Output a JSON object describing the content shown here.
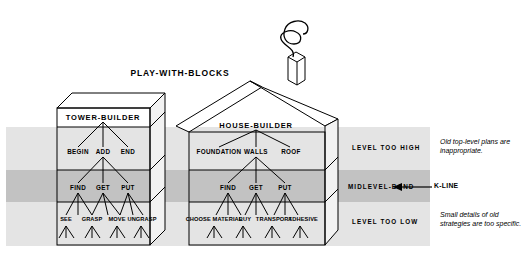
{
  "diagram": {
    "title": "PLAY-WITH-BLOCKS",
    "colors": {
      "ink": "#000000",
      "band_light": "#e2e2e2",
      "band_mid": "#bfbfbf",
      "face": "#ffffff",
      "side_face": "#f0f0f0"
    },
    "trees": [
      {
        "name": "tower-builder",
        "root": "TOWER-BUILDER",
        "level2": [
          "BEGIN",
          "ADD",
          "END"
        ],
        "level3": [
          "FIND",
          "GET",
          "PUT"
        ],
        "leaves": [
          "SEE",
          "GRASP",
          "MOVE",
          "UNGRASP"
        ]
      },
      {
        "name": "house-builder",
        "root": "HOUSE-BUILDER",
        "level2": [
          "FOUNDATION",
          "WALLS",
          "ROOF"
        ],
        "level3": [
          "FIND",
          "GET",
          "PUT"
        ],
        "leaves": [
          "CHOOSE MATERIAL",
          "BUY",
          "TRANSPORT",
          "ADHESIVE"
        ]
      }
    ],
    "bands": [
      {
        "id": "high",
        "label": "LEVEL TOO HIGH"
      },
      {
        "id": "mid",
        "label": "MIDLEVEL-BAND"
      },
      {
        "id": "low",
        "label": "LEVEL TOO LOW"
      }
    ],
    "kline": {
      "label": "K-LINE"
    },
    "notes": [
      {
        "id": "top-note",
        "text": "Old top-level plans are inappropriate."
      },
      {
        "id": "bottom-note",
        "text": "Small details of old strategies are too specific."
      }
    ]
  }
}
